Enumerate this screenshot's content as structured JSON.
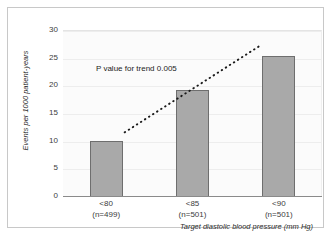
{
  "chart_data": {
    "type": "bar",
    "title": "",
    "categories": [
      "<80",
      "<85",
      "<90"
    ],
    "category_sublabels": [
      "(n=499)",
      "(n=501)",
      "(n=501)"
    ],
    "values": [
      10.2,
      19.4,
      25.5
    ],
    "xlabel": "Target diastolic blood pressure (mm Hg)",
    "ylabel": "Events per 1000 patient-years",
    "ylim": [
      0,
      30
    ],
    "yticks": [
      0,
      5,
      10,
      15,
      20,
      25,
      30
    ],
    "ytick_labels": [
      "0",
      "5",
      "10",
      "15",
      "20",
      "25",
      "30"
    ],
    "grid": true,
    "legend": "none",
    "annotations": [
      {
        "name": "p-value-for-trend",
        "text": "P value for trend 0.005"
      }
    ],
    "trend_line": {
      "style": "dotted",
      "color": "#1a1a1a",
      "from": {
        "x_category_index": 0,
        "y": 11.5
      },
      "to": {
        "x_category_index": 2,
        "y": 27.2
      }
    },
    "colors": {
      "bar_fill": "#a9a9a9",
      "bar_border": "#6e6e6e",
      "grid": "#ededed",
      "axis": "#8a8a8a",
      "text": "#2a2a2a",
      "plot_background": "#fbfbfb",
      "frame_border": "#c8c8c8"
    }
  }
}
